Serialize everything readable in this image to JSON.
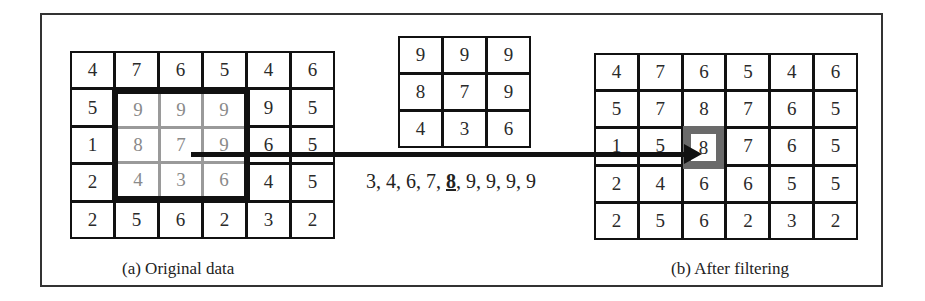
{
  "figure": {
    "left_panel": {
      "caption": "(a) Original data",
      "grid": [
        [
          "4",
          "7",
          "6",
          "5",
          "4",
          "6"
        ],
        [
          "5",
          "9",
          "9",
          "9",
          "9",
          "5"
        ],
        [
          "1",
          "8",
          "7",
          "9",
          "6",
          "5"
        ],
        [
          "2",
          "4",
          "3",
          "6",
          "4",
          "5"
        ],
        [
          "2",
          "5",
          "6",
          "2",
          "3",
          "2"
        ]
      ],
      "window": {
        "rows": [
          1,
          2,
          3
        ],
        "cols": [
          1,
          2,
          3
        ],
        "values": [
          [
            "9",
            "9",
            "9"
          ],
          [
            "8",
            "7",
            "9"
          ],
          [
            "4",
            "3",
            "6"
          ]
        ]
      }
    },
    "middle_panel": {
      "kernel": [
        [
          "9",
          "9",
          "9"
        ],
        [
          "8",
          "7",
          "9"
        ],
        [
          "4",
          "3",
          "6"
        ]
      ],
      "sorted_sequence": {
        "before_median": "3, 4, 6, 7, ",
        "median": "8",
        "after_median": ", 9, 9, 9, 9"
      }
    },
    "right_panel": {
      "caption": "(b) After filtering",
      "grid": [
        [
          "4",
          "7",
          "6",
          "5",
          "4",
          "6"
        ],
        [
          "5",
          "7",
          "8",
          "7",
          "6",
          "5"
        ],
        [
          "1",
          "5",
          "8",
          "7",
          "6",
          "5"
        ],
        [
          "2",
          "4",
          "6",
          "6",
          "5",
          "5"
        ],
        [
          "2",
          "5",
          "6",
          "2",
          "3",
          "2"
        ]
      ],
      "highlighted_cell": {
        "row": 2,
        "col": 2,
        "value": "8"
      }
    },
    "colors": {
      "line": "#111111",
      "window_inner_line": "#9a9a9a",
      "window_text": "#8a8a8a",
      "highlight_border": "#6a6a6a"
    }
  }
}
